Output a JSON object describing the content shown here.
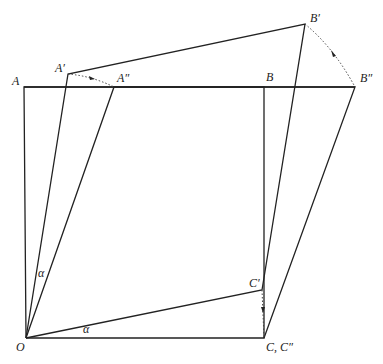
{
  "diagram": {
    "type": "geometric-shear-rotation",
    "points": {
      "A": {
        "label": "A",
        "x": 24,
        "y": 87
      },
      "A_prime": {
        "label": "A′",
        "x": 68,
        "y": 74
      },
      "A_dprime": {
        "label": "A″",
        "x": 114,
        "y": 87
      },
      "B": {
        "label": "B",
        "x": 264,
        "y": 87
      },
      "B_prime": {
        "label": "B′",
        "x": 305,
        "y": 24
      },
      "B_dprime": {
        "label": "B″",
        "x": 355,
        "y": 87
      },
      "O": {
        "label": "O",
        "x": 26,
        "y": 338
      },
      "C": {
        "label": "C, C″",
        "x": 264,
        "y": 338
      },
      "C_prime": {
        "label": "C′",
        "x": 262,
        "y": 290
      }
    },
    "angle_labels": [
      {
        "label": "α",
        "x": 38,
        "y": 277
      },
      {
        "label": "α",
        "x": 83,
        "y": 333
      }
    ]
  }
}
